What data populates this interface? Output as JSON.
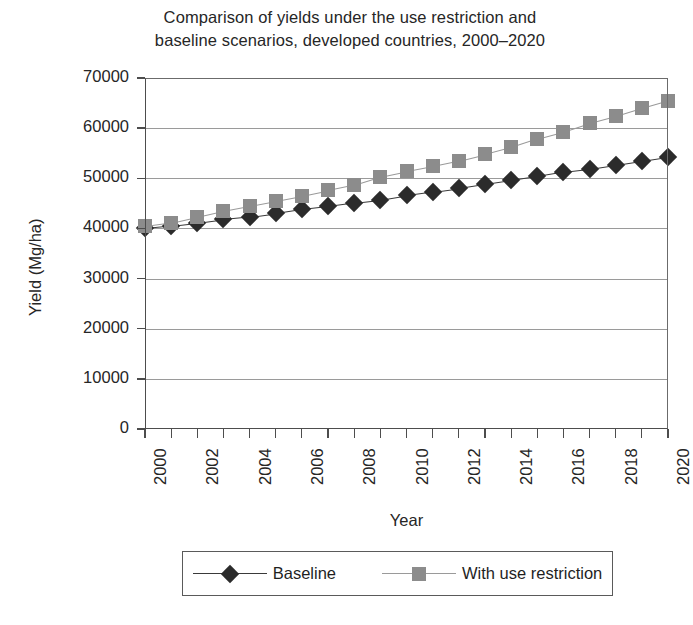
{
  "chart_data": {
    "type": "line",
    "title": "Comparison of yields under the use restriction and baseline scenarios, developed countries, 2000–2020",
    "title_lines": [
      "Comparison of yields under the use restriction and",
      "baseline scenarios, developed countries, 2000–2020"
    ],
    "xlabel": "Year",
    "ylabel": "Yield (Mg/ha)",
    "xlim": [
      2000,
      2020
    ],
    "ylim": [
      0,
      70000
    ],
    "grid": true,
    "legend_position": "bottom",
    "x": [
      2000,
      2001,
      2002,
      2003,
      2004,
      2005,
      2006,
      2007,
      2008,
      2009,
      2010,
      2011,
      2012,
      2013,
      2014,
      2015,
      2016,
      2017,
      2018,
      2019,
      2020
    ],
    "xtick_labels": [
      "2000",
      "2002",
      "2004",
      "2006",
      "2008",
      "2010",
      "2012",
      "2014",
      "2016",
      "2018",
      "2020"
    ],
    "xtick_values": [
      2000,
      2002,
      2004,
      2006,
      2008,
      2010,
      2012,
      2014,
      2016,
      2018,
      2020
    ],
    "ytick_labels": [
      "0",
      "10000",
      "20000",
      "30000",
      "40000",
      "50000",
      "60000",
      "70000"
    ],
    "ytick_values": [
      0,
      10000,
      20000,
      30000,
      40000,
      50000,
      60000,
      70000
    ],
    "series": [
      {
        "name": "Baseline",
        "marker": "diamond",
        "color": "#2b2b2b",
        "line_color": "#3a3a3a",
        "values": [
          40000,
          40500,
          41100,
          41800,
          42300,
          43000,
          43800,
          44400,
          45100,
          45700,
          46600,
          47300,
          48000,
          48800,
          49600,
          50400,
          51300,
          51900,
          52700,
          53500,
          54300
        ]
      },
      {
        "name": "With use restriction",
        "marker": "square",
        "color": "#8c8c8c",
        "line_color": "#9a9a9a",
        "values": [
          40400,
          41100,
          42300,
          43500,
          44500,
          45500,
          46500,
          47600,
          48700,
          50300,
          51400,
          52400,
          53500,
          54800,
          56200,
          57900,
          59300,
          61000,
          62400,
          64000,
          65500
        ]
      }
    ]
  },
  "legend": {
    "entries": [
      {
        "label": "Baseline"
      },
      {
        "label": "With use restriction"
      }
    ]
  }
}
